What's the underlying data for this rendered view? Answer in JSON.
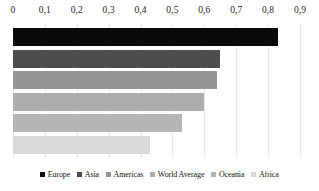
{
  "chart_data": {
    "type": "bar",
    "orientation": "horizontal",
    "title": "",
    "xlabel": "",
    "ylabel": "",
    "xlim": [
      0,
      0.9
    ],
    "grid": true,
    "axis_position": "top",
    "decimal_separator": ",",
    "legend_position": "bottom",
    "tick_labels": [
      "0",
      "0,1",
      "0,2",
      "0,3",
      "0,4",
      "0,5",
      "0,6",
      "0,7",
      "0,8",
      "0,9"
    ],
    "tick_values": [
      0,
      0.1,
      0.2,
      0.3,
      0.4,
      0.5,
      0.6,
      0.7,
      0.8,
      0.9
    ],
    "categories": [
      "Europe",
      "Asia",
      "Americas",
      "World Average",
      "Oceania",
      "Africa"
    ],
    "values": [
      0.83,
      0.65,
      0.64,
      0.6,
      0.53,
      0.43
    ],
    "colors": [
      "#0a0a0a",
      "#4d4d4d",
      "#969696",
      "#adadad",
      "#b5b5b5",
      "#d9d9d9"
    ],
    "series": [
      {
        "name": "Europe",
        "value": 0.83,
        "color": "#0a0a0a"
      },
      {
        "name": "Asia",
        "value": 0.65,
        "color": "#4d4d4d"
      },
      {
        "name": "Americas",
        "value": 0.64,
        "color": "#969696"
      },
      {
        "name": "World Average",
        "value": 0.6,
        "color": "#adadad"
      },
      {
        "name": "Oceania",
        "value": 0.53,
        "color": "#b5b5b5"
      },
      {
        "name": "Africa",
        "value": 0.43,
        "color": "#d9d9d9"
      }
    ],
    "gridline_color": "#e9e9e9",
    "background_color": "#ffffff"
  }
}
